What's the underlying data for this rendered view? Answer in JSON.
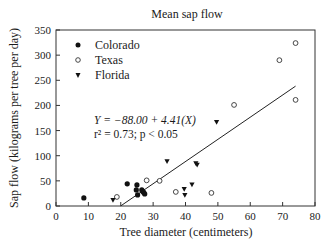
{
  "chart_data": {
    "type": "scatter",
    "title": "Mean sap flow",
    "xlabel": "Tree diameter (centimeters)",
    "ylabel": "Sap flow (kilograms per tree per day)",
    "xlim": [
      0,
      80
    ],
    "ylim": [
      0,
      350
    ],
    "xticks": [
      0,
      10,
      20,
      30,
      40,
      50,
      60,
      70,
      80
    ],
    "yticks": [
      0,
      50,
      100,
      150,
      200,
      250,
      300,
      350
    ],
    "grid": false,
    "legend_position": "upper-left",
    "series": [
      {
        "name": "Colorado",
        "marker": "filled-circle",
        "points": [
          [
            8.6,
            16
          ],
          [
            22,
            44
          ],
          [
            25,
            42
          ],
          [
            24.8,
            32
          ],
          [
            25.2,
            22
          ],
          [
            26.5,
            32
          ],
          [
            26.8,
            29
          ],
          [
            27.1,
            27
          ],
          [
            27.4,
            24
          ]
        ]
      },
      {
        "name": "Texas",
        "marker": "open-circle",
        "points": [
          [
            18.8,
            18
          ],
          [
            28,
            51
          ],
          [
            32,
            50
          ],
          [
            37,
            28
          ],
          [
            48,
            26
          ],
          [
            55,
            201
          ],
          [
            69,
            290
          ],
          [
            74,
            324
          ],
          [
            74,
            211
          ]
        ]
      },
      {
        "name": "Florida",
        "marker": "filled-triangle-down",
        "points": [
          [
            17.6,
            12
          ],
          [
            34.3,
            89
          ],
          [
            39.6,
            34
          ],
          [
            39.8,
            22
          ],
          [
            42,
            43
          ],
          [
            43.2,
            85
          ],
          [
            43.6,
            82
          ],
          [
            49.6,
            167
          ]
        ]
      }
    ],
    "regression": {
      "equation": "Y = −88.00 + 4.41(X)",
      "r2_text": "r² = 0.73; p < 0.05",
      "intercept": -88.0,
      "slope": 4.41,
      "x_range": [
        20,
        74
      ]
    }
  }
}
